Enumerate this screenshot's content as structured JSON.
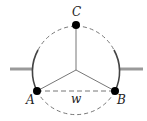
{
  "diagram": {
    "type": "feynman-diagram",
    "vertices": [
      {
        "id": "A",
        "label": "A"
      },
      {
        "id": "B",
        "label": "B"
      },
      {
        "id": "C",
        "label": "C"
      }
    ],
    "internal_label": "w",
    "colors": {
      "line": "#555555",
      "dashed": "#777777",
      "leg": "#999999",
      "vertex": "#000000"
    }
  }
}
